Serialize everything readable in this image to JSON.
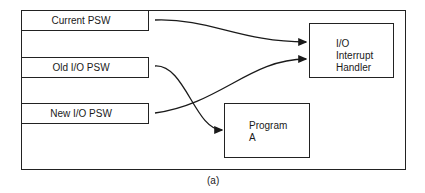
{
  "diagram": {
    "boxes": {
      "current_psw": "Current PSW",
      "old_io_psw": "Old I/O PSW",
      "new_io_psw": "New I/O PSW",
      "handler": {
        "line1": "I/O",
        "line2": "Interrupt",
        "line3": "Handler"
      },
      "program": {
        "line1": "Program",
        "line2": "A"
      }
    },
    "edges": [
      {
        "from": "Current PSW",
        "to": "I/O Interrupt Handler"
      },
      {
        "from": "Old I/O PSW",
        "to": "Program A"
      },
      {
        "from": "New I/O PSW",
        "to": "I/O Interrupt Handler"
      }
    ],
    "caption": "(a)",
    "line_color": "#1a1a1a"
  }
}
